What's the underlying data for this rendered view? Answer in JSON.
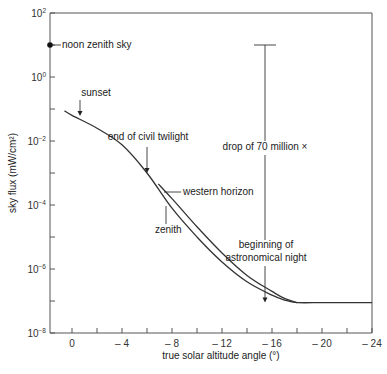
{
  "chart_data": {
    "type": "line",
    "title": "",
    "xlabel": "true solar altitude angle (°)",
    "ylabel": "sky flux (mW/cm²)",
    "y_scale": "log",
    "xlim": [
      1.76,
      -24
    ],
    "ylim_log10": [
      -8,
      2
    ],
    "x_ticks": [
      0,
      -2,
      -4,
      -6,
      -8,
      -10,
      -12,
      -14,
      -16,
      -18,
      -20,
      -22,
      -24
    ],
    "x_tick_labels": [
      {
        "value": 0,
        "text": "0"
      },
      {
        "value": -4,
        "text": "– 4"
      },
      {
        "value": -8,
        "text": "– 8"
      },
      {
        "value": -12,
        "text": "– 12"
      },
      {
        "value": -16,
        "text": "– 16"
      },
      {
        "value": -20,
        "text": "– 20"
      },
      {
        "value": -24,
        "text": "– 24"
      }
    ],
    "y_ticks_log10": [
      2,
      1,
      0,
      -1,
      -2,
      -3,
      -4,
      -5,
      -6,
      -7,
      -8
    ],
    "y_tick_labels": [
      {
        "log10": 2,
        "base": "10",
        "exp": "2"
      },
      {
        "log10": 0,
        "base": "10",
        "exp": "0"
      },
      {
        "log10": -2,
        "base": "10",
        "exp": "-2"
      },
      {
        "log10": -4,
        "base": "10",
        "exp": "-4"
      },
      {
        "log10": -6,
        "base": "10",
        "exp": "-6"
      },
      {
        "log10": -8,
        "base": "10",
        "exp": "-8"
      }
    ],
    "grid": false,
    "legend": null,
    "series": [
      {
        "name": "zenith",
        "x": [
          0.6,
          0,
          -2,
          -4,
          -6,
          -8,
          -10,
          -12,
          -14,
          -16,
          -17,
          -18,
          -20,
          -22,
          -24
        ],
        "log10_y": [
          -1.06,
          -1.2,
          -1.6,
          -2.12,
          -3.0,
          -4.1,
          -5.0,
          -5.78,
          -6.4,
          -6.82,
          -6.97,
          -7.05,
          -7.05,
          -7.05,
          -7.05
        ]
      },
      {
        "name": "western horizon",
        "x": [
          -6.9,
          -8,
          -10,
          -12,
          -14,
          -16,
          -17,
          -18
        ],
        "log10_y": [
          -3.34,
          -3.8,
          -4.68,
          -5.5,
          -6.2,
          -6.7,
          -6.92,
          -7.05
        ]
      }
    ],
    "points": [
      {
        "name": "noon zenith sky",
        "x": 1.76,
        "log10_y": 1.0
      }
    ],
    "annotations": [
      {
        "text": "noon zenith sky",
        "x_px": 62,
        "y_px": 48
      },
      {
        "text": "sunset",
        "x_px": 82,
        "y_px": 96,
        "arrow_x": 80,
        "arrow_from_y": 100,
        "arrow_to_y": 116
      },
      {
        "text": "end of civil twilight",
        "x_px": 125,
        "y_px": 140,
        "arrow_x": 147,
        "arrow_from_y": 147,
        "arrow_to_y": 173
      },
      {
        "text": "western horizon",
        "x_px": 183,
        "y_px": 195
      },
      {
        "text": "zenith",
        "x_px": 155,
        "y_px": 233
      },
      {
        "text": "drop of 70 million ×",
        "x_px": 253,
        "y_px": 150
      },
      {
        "text": "beginning of",
        "x_px": 266,
        "y_px": 248
      },
      {
        "text": "astronomical night",
        "x_px": 266,
        "y_px": 261
      }
    ],
    "measurement_bar": {
      "x": -18,
      "from_log10": 1.0,
      "to_log10": -7.05,
      "label": "drop of 70 million ×"
    }
  }
}
